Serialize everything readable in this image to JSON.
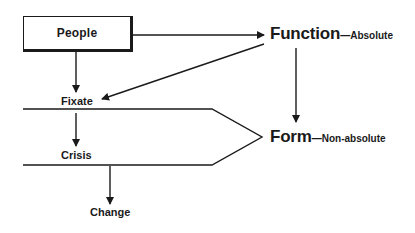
{
  "diagram": {
    "nodes": {
      "people": "People",
      "fixate": "Fixate",
      "crisis": "Crisis",
      "change": "Change",
      "function": "Function",
      "function_suffix": "—Absolute",
      "form": "Form",
      "form_suffix": "—Non-absolute"
    },
    "edges": [
      {
        "from": "People",
        "to": "Function"
      },
      {
        "from": "People",
        "to": "Fixate"
      },
      {
        "from": "Function",
        "to": "Fixate"
      },
      {
        "from": "Function",
        "to": "Form"
      },
      {
        "from": "Fixate",
        "to": "Crisis"
      },
      {
        "from": "Crisis",
        "to": "Change"
      }
    ],
    "colors": {
      "stroke": "#1a1a1a",
      "background": "#ffffff"
    }
  }
}
